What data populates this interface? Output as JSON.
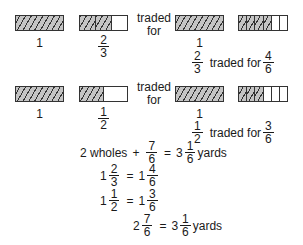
{
  "colors": {
    "shade": "#c4c4c4",
    "line": "#333333",
    "text": "#1a1a1a"
  },
  "rows": [
    {
      "left_whole": {
        "label": "1",
        "cells": 1,
        "shaded": 1
      },
      "left_part": {
        "num": "2",
        "den": "3",
        "cells": 3,
        "shaded": 2
      },
      "traded_text": [
        "traded",
        "for"
      ],
      "right_whole": {
        "label": "1",
        "cells": 1,
        "shaded": 1
      },
      "right_part": {
        "cells": 6,
        "shaded": 4
      },
      "caption": {
        "a_num": "2",
        "a_den": "3",
        "text": "traded for",
        "b_num": "4",
        "b_den": "6"
      }
    },
    {
      "left_whole": {
        "label": "1",
        "cells": 1,
        "shaded": 1
      },
      "left_part": {
        "num": "1",
        "den": "2",
        "cells": 2,
        "shaded": 1
      },
      "traded_text": [
        "traded",
        "for"
      ],
      "right_whole": {
        "label": "1",
        "cells": 1,
        "shaded": 1
      },
      "right_part": {
        "cells": 6,
        "shaded": 3
      },
      "caption": {
        "a_num": "1",
        "a_den": "2",
        "text": "traded for",
        "b_num": "3",
        "b_den": "6"
      }
    }
  ],
  "equations": {
    "eq1": {
      "lead": "2 wholes",
      "plus": "+",
      "f_num": "7",
      "f_den": "6",
      "eq": "=",
      "whole": "3",
      "r_num": "1",
      "r_den": "6",
      "unit": "yards"
    },
    "eq2": {
      "whole": "1",
      "f_num": "2",
      "f_den": "3",
      "eq": "=",
      "r_whole": "1",
      "r_num": "4",
      "r_den": "6"
    },
    "eq3": {
      "whole": "1",
      "f_num": "1",
      "f_den": "2",
      "eq": "=",
      "r_whole": "1",
      "r_num": "3",
      "r_den": "6"
    },
    "eq4": {
      "whole": "2",
      "f_num": "7",
      "f_den": "6",
      "eq": "=",
      "r_whole": "3",
      "r_num": "1",
      "r_den": "6",
      "unit": "yards"
    }
  }
}
